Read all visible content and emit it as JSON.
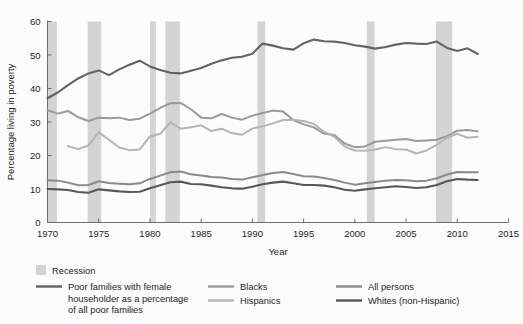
{
  "chart_data": {
    "type": "line",
    "title": "",
    "xlabel": "Year",
    "ylabel": "Percentage living in poverty",
    "xlim": [
      1970,
      2015
    ],
    "ylim": [
      0,
      60
    ],
    "xticks": [
      1970,
      1975,
      1980,
      1985,
      1990,
      1995,
      2000,
      2005,
      2010,
      2015
    ],
    "yticks": [
      0,
      10,
      20,
      30,
      40,
      50,
      60
    ],
    "grid": false,
    "legend_position": "bottom",
    "colors": {
      "recession_band": "#d4d4d4",
      "poor_families_female_householder": "#636363",
      "blacks": "#9a9a9a",
      "hispanics": "#b5b5b5",
      "all_persons": "#8a8a8a",
      "whites_non_hispanic": "#58585a",
      "axis": "#6d6e71",
      "background": "#fcfcfc"
    },
    "recessions": [
      {
        "start": 1969.92,
        "end": 1970.92
      },
      {
        "start": 1973.92,
        "end": 1975.25
      },
      {
        "start": 1980.0,
        "end": 1980.58
      },
      {
        "start": 1981.5,
        "end": 1982.92
      },
      {
        "start": 1990.5,
        "end": 1991.25
      },
      {
        "start": 2001.17,
        "end": 2001.92
      },
      {
        "start": 2007.92,
        "end": 2009.5
      }
    ],
    "series": [
      {
        "name": "Poor families with female householder as a percentage of all poor families",
        "key": "poor_families_female_householder",
        "color": "#636363",
        "width": 2.1,
        "x": [
          1970,
          1971,
          1972,
          1973,
          1974,
          1975,
          1976,
          1977,
          1978,
          1979,
          1980,
          1981,
          1982,
          1983,
          1984,
          1985,
          1986,
          1987,
          1988,
          1989,
          1990,
          1991,
          1992,
          1993,
          1994,
          1995,
          1996,
          1997,
          1998,
          1999,
          2000,
          2001,
          2002,
          2003,
          2004,
          2005,
          2006,
          2007,
          2008,
          2009,
          2010,
          2011,
          2012
        ],
        "values": [
          37.1,
          38.8,
          41.0,
          43.0,
          44.5,
          45.4,
          44.0,
          45.7,
          47.1,
          48.3,
          46.6,
          45.5,
          44.7,
          44.5,
          45.3,
          46.1,
          47.4,
          48.4,
          49.2,
          49.5,
          50.4,
          53.4,
          52.8,
          52.0,
          51.6,
          53.5,
          54.6,
          54.1,
          54.0,
          53.6,
          52.9,
          52.5,
          51.9,
          52.4,
          53.1,
          53.6,
          53.4,
          53.3,
          54.0,
          52.1,
          51.2,
          52.0,
          50.3
        ]
      },
      {
        "name": "Blacks",
        "key": "blacks",
        "color": "#9a9a9a",
        "width": 2.0,
        "x": [
          1970,
          1971,
          1972,
          1973,
          1974,
          1975,
          1976,
          1977,
          1978,
          1979,
          1980,
          1981,
          1982,
          1983,
          1984,
          1985,
          1986,
          1987,
          1988,
          1989,
          1990,
          1991,
          1992,
          1993,
          1994,
          1995,
          1996,
          1997,
          1998,
          1999,
          2000,
          2001,
          2002,
          2003,
          2004,
          2005,
          2006,
          2007,
          2008,
          2009,
          2010,
          2011,
          2012
        ],
        "values": [
          33.5,
          32.5,
          33.3,
          31.4,
          30.3,
          31.3,
          31.1,
          31.3,
          30.6,
          31.0,
          32.5,
          34.2,
          35.6,
          35.7,
          33.8,
          31.3,
          31.1,
          32.4,
          31.3,
          30.7,
          31.9,
          32.7,
          33.4,
          33.1,
          30.6,
          29.3,
          28.4,
          26.5,
          26.1,
          23.6,
          22.5,
          22.7,
          24.1,
          24.4,
          24.7,
          24.9,
          24.3,
          24.5,
          24.7,
          25.8,
          27.4,
          27.6,
          27.2
        ]
      },
      {
        "name": "Hispanics",
        "key": "hispanics",
        "color": "#b5b5b5",
        "width": 2.0,
        "x": [
          1972,
          1973,
          1974,
          1975,
          1976,
          1977,
          1978,
          1979,
          1980,
          1981,
          1982,
          1983,
          1984,
          1985,
          1986,
          1987,
          1988,
          1989,
          1990,
          1991,
          1992,
          1993,
          1994,
          1995,
          1996,
          1997,
          1998,
          1999,
          2000,
          2001,
          2002,
          2003,
          2004,
          2005,
          2006,
          2007,
          2008,
          2009,
          2010,
          2011,
          2012
        ],
        "values": [
          22.8,
          21.9,
          23.0,
          26.9,
          24.7,
          22.4,
          21.6,
          21.8,
          25.7,
          26.5,
          29.9,
          28.0,
          28.4,
          29.0,
          27.3,
          28.0,
          26.7,
          26.2,
          28.1,
          28.7,
          29.6,
          30.6,
          30.7,
          30.3,
          29.4,
          27.1,
          25.6,
          22.7,
          21.5,
          21.4,
          21.8,
          22.5,
          21.9,
          21.8,
          20.6,
          21.5,
          23.2,
          25.3,
          26.5,
          25.3,
          25.6
        ]
      },
      {
        "name": "All persons",
        "key": "all_persons",
        "color": "#8a8a8a",
        "width": 2.0,
        "x": [
          1970,
          1971,
          1972,
          1973,
          1974,
          1975,
          1976,
          1977,
          1978,
          1979,
          1980,
          1981,
          1982,
          1983,
          1984,
          1985,
          1986,
          1987,
          1988,
          1989,
          1990,
          1991,
          1992,
          1993,
          1994,
          1995,
          1996,
          1997,
          1998,
          1999,
          2000,
          2001,
          2002,
          2003,
          2004,
          2005,
          2006,
          2007,
          2008,
          2009,
          2010,
          2011,
          2012
        ],
        "values": [
          12.6,
          12.5,
          11.9,
          11.1,
          11.2,
          12.3,
          11.8,
          11.6,
          11.4,
          11.7,
          13.0,
          14.0,
          15.0,
          15.2,
          14.4,
          14.0,
          13.6,
          13.4,
          13.0,
          12.8,
          13.5,
          14.2,
          14.8,
          15.1,
          14.5,
          13.8,
          13.7,
          13.3,
          12.7,
          11.9,
          11.3,
          11.7,
          12.1,
          12.5,
          12.7,
          12.6,
          12.3,
          12.5,
          13.2,
          14.3,
          15.1,
          15.0,
          15.0
        ]
      },
      {
        "name": "Whites (non-Hispanic)",
        "key": "whites_non_hispanic",
        "color": "#58585a",
        "width": 2.1,
        "x": [
          1970,
          1971,
          1972,
          1973,
          1974,
          1975,
          1976,
          1977,
          1978,
          1979,
          1980,
          1981,
          1982,
          1983,
          1984,
          1985,
          1986,
          1987,
          1988,
          1989,
          1990,
          1991,
          1992,
          1993,
          1994,
          1995,
          1996,
          1997,
          1998,
          1999,
          2000,
          2001,
          2002,
          2003,
          2004,
          2005,
          2006,
          2007,
          2008,
          2009,
          2010,
          2011,
          2012
        ],
        "values": [
          10.0,
          9.9,
          9.7,
          9.1,
          8.9,
          9.9,
          9.6,
          9.3,
          9.1,
          9.2,
          10.2,
          11.1,
          12.0,
          12.2,
          11.5,
          11.4,
          11.0,
          10.5,
          10.2,
          10.1,
          10.7,
          11.4,
          11.9,
          12.2,
          11.7,
          11.2,
          11.2,
          11.0,
          10.5,
          9.8,
          9.5,
          9.9,
          10.2,
          10.5,
          10.8,
          10.6,
          10.3,
          10.5,
          11.2,
          12.3,
          13.0,
          12.8,
          12.7
        ]
      }
    ]
  },
  "axis": {
    "ylabel": "Percentage living in poverty",
    "xlabel": "Year",
    "xticks": [
      "1970",
      "1975",
      "1980",
      "1985",
      "1990",
      "1995",
      "2000",
      "2005",
      "2010",
      "2015"
    ],
    "yticks": [
      "0",
      "10",
      "20",
      "30",
      "40",
      "50",
      "60"
    ]
  },
  "legend": {
    "recession_label": "Recession",
    "entries": [
      {
        "label_lines": [
          "Poor families with female",
          "householder as a percentage",
          "of all poor families"
        ],
        "color_key": "poor_families_female_householder"
      },
      {
        "label_lines": [
          "Blacks"
        ],
        "color_key": "blacks"
      },
      {
        "label_lines": [
          "Hispanics"
        ],
        "color_key": "hispanics"
      },
      {
        "label_lines": [
          "All persons"
        ],
        "color_key": "all_persons"
      },
      {
        "label_lines": [
          "Whites (non-Hispanic)"
        ],
        "color_key": "whites_non_hispanic"
      }
    ]
  }
}
